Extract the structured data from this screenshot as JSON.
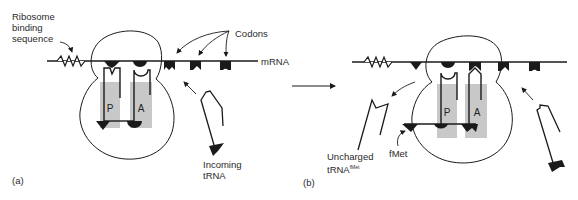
{
  "figure": {
    "colors": {
      "line": "#1a1a1a",
      "site_fill": "#c8c8c8",
      "background": "#ffffff"
    }
  },
  "panel_a": {
    "label": "(a)",
    "ribosome_binding_sequence_label": [
      "Ribosome",
      "binding",
      "sequence"
    ],
    "codons_label": "Codons",
    "mrna_label": "mRNA",
    "p_site": "P",
    "a_site": "A",
    "incoming_trna_label": [
      "Incoming",
      "tRNA"
    ]
  },
  "panel_b": {
    "label": "(b)",
    "p_site": "P",
    "a_site": "A",
    "uncharged_label": "Uncharged",
    "trna_label": "tRNA",
    "trna_superscript": "fMet",
    "fmet_label": "fMet"
  },
  "transition_arrow": "right-arrow"
}
